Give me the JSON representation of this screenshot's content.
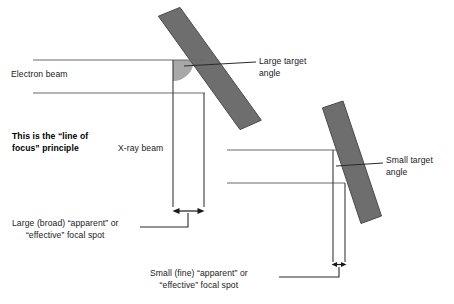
{
  "diagram": {
    "title_text": "This is the “line of focus” principle",
    "background_color": "#ffffff",
    "anode_color": "#6e6e6e",
    "anode_edge_color": "#4a4a4a",
    "angle_wedge_color": "#a8a8a8",
    "line_color": "#6b6b6b",
    "dark_line_color": "#1a1a1a",
    "text_color": "#1a1a1a"
  },
  "labels": {
    "electron_beam": "Electron beam",
    "large_target_angle_line1": "Large target",
    "large_target_angle_line2": "angle",
    "principle_line1": "This is the “line of",
    "principle_line2": "focus” principle",
    "xray_beam": "X-ray beam",
    "small_target_angle_line1": "Small target",
    "small_target_angle_line2": "angle",
    "large_focal_spot_line1": "Large (broad) “apparent” or",
    "large_focal_spot_line2": "“effective” focal spot",
    "small_focal_spot_line1": "Small (fine) “apparent” or",
    "small_focal_spot_line2": "“effective” focal spot"
  }
}
